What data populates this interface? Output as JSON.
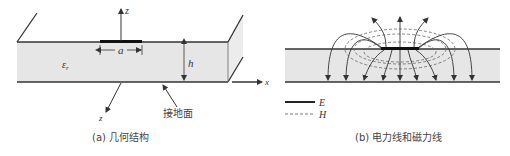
{
  "figure_a": {
    "caption": "(a) 几何结构",
    "labels": {
      "z_up": "z",
      "z_out": "z",
      "x_axis": "x",
      "width": "a",
      "height": "h",
      "permittivity": "ε",
      "permittivity_sub": "r",
      "ground_plane": "接地面"
    }
  },
  "figure_b": {
    "caption": "(b) 电力线和磁力线",
    "legend": [
      {
        "symbol": "solid",
        "label": "E"
      },
      {
        "symbol": "dashed",
        "label": "H"
      }
    ]
  },
  "colors": {
    "substrate": "#e6e6e6",
    "line": "#333333",
    "strip": "#111111"
  }
}
